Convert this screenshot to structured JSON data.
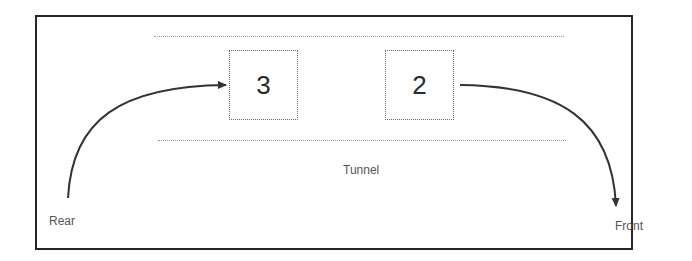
{
  "diagram": {
    "title": "",
    "tunnel_label": "Tunnel",
    "rear_label": "Rear",
    "front_label": "Front",
    "nodes": [
      {
        "id": "node-3",
        "value": "3"
      },
      {
        "id": "node-2",
        "value": "2"
      }
    ],
    "edges": [
      {
        "from": "Rear",
        "to": "3",
        "kind": "enqueue-arrow"
      },
      {
        "from": "2",
        "to": "Front",
        "kind": "dequeue-arrow"
      }
    ],
    "colors": {
      "frame": "#262626",
      "arrow": "#333333",
      "dotted_line": "#9a9a9a",
      "node_border": "#6a6a6a",
      "text": "#555555"
    }
  }
}
